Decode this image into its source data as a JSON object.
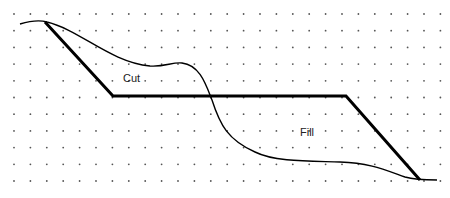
{
  "diagram": {
    "labels": {
      "cut": "Cut",
      "fill": "Fill"
    },
    "elements": [
      {
        "name": "dot-grid",
        "description": "background grid of dots"
      },
      {
        "name": "existing-ground-curve",
        "description": "thin curved line representing natural ground"
      },
      {
        "name": "design-grade-line",
        "description": "thick line representing finished grade: slope down, flat bench, slope down"
      }
    ],
    "colors": {
      "line": "#000000",
      "dot": "#555555",
      "background": "#ffffff"
    }
  }
}
